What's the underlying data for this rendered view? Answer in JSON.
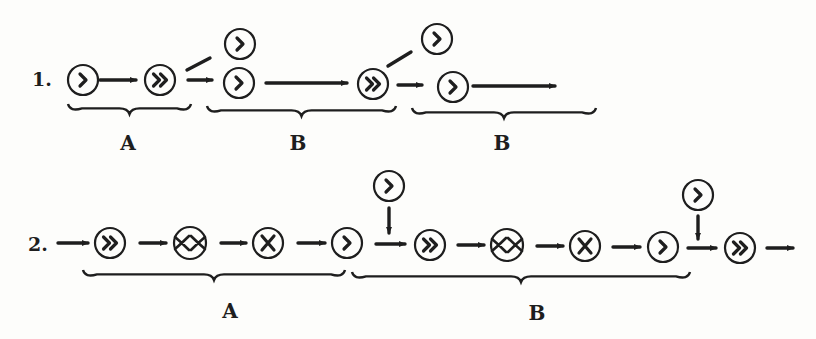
{
  "figure": {
    "background": "#fdfdfb",
    "ink": "#1e1e1e",
    "glyph_legend": {
      "single-chevron": "›",
      "double-chevron": "»",
      "cross": "×",
      "double-cross": "XX"
    },
    "rows": [
      {
        "label": "1.",
        "label_pos": [
          32,
          86
        ],
        "nodes": [
          {
            "id": "r1n1",
            "glyph": "single-chevron",
            "cx": 83,
            "cy": 80
          },
          {
            "id": "r1n2",
            "glyph": "double-chevron",
            "cx": 160,
            "cy": 80
          },
          {
            "id": "r1n3",
            "glyph": "single-chevron",
            "cx": 240,
            "cy": 44
          },
          {
            "id": "r1n4",
            "glyph": "single-chevron",
            "cx": 239,
            "cy": 83
          },
          {
            "id": "r1n5",
            "glyph": "double-chevron",
            "cx": 373,
            "cy": 84
          },
          {
            "id": "r1n6",
            "glyph": "single-chevron",
            "cx": 437,
            "cy": 39
          },
          {
            "id": "r1n7",
            "glyph": "single-chevron",
            "cx": 453,
            "cy": 87
          }
        ],
        "edges": [
          {
            "from": [
              100,
              80
            ],
            "to": [
              136,
              80
            ],
            "arrow": true
          },
          {
            "from": [
              187,
              70
            ],
            "to": [
              210,
              58
            ],
            "arrow": false
          },
          {
            "from": [
              188,
              80
            ],
            "to": [
              212,
              80
            ],
            "arrow": true
          },
          {
            "from": [
              266,
              83
            ],
            "to": [
              347,
              83
            ],
            "arrow": true
          },
          {
            "from": [
              388,
              66
            ],
            "to": [
              411,
              52
            ],
            "arrow": false
          },
          {
            "from": [
              398,
              85
            ],
            "to": [
              422,
              85
            ],
            "arrow": true
          },
          {
            "from": [
              473,
              86
            ],
            "to": [
              555,
              86
            ],
            "arrow": true
          }
        ],
        "braces": [
          {
            "label": "A",
            "x1": 68,
            "x2": 191,
            "y": 104,
            "label_x": 128,
            "label_y": 150
          },
          {
            "label": "B",
            "x1": 207,
            "x2": 396,
            "y": 106,
            "label_x": 298,
            "label_y": 150
          },
          {
            "label": "B",
            "x1": 412,
            "x2": 596,
            "y": 108,
            "label_x": 502,
            "label_y": 150
          }
        ]
      },
      {
        "label": "2.",
        "label_pos": [
          28,
          251
        ],
        "nodes": [
          {
            "id": "r2n1",
            "glyph": "double-chevron",
            "cx": 110,
            "cy": 243
          },
          {
            "id": "r2n2",
            "glyph": "double-cross",
            "cx": 190,
            "cy": 243
          },
          {
            "id": "r2n3",
            "glyph": "cross",
            "cx": 268,
            "cy": 243
          },
          {
            "id": "r2n4",
            "glyph": "single-chevron",
            "cx": 347,
            "cy": 243
          },
          {
            "id": "r2n5",
            "glyph": "single-chevron",
            "cx": 389,
            "cy": 186
          },
          {
            "id": "r2n6",
            "glyph": "double-chevron",
            "cx": 430,
            "cy": 245
          },
          {
            "id": "r2n7",
            "glyph": "double-cross",
            "cx": 507,
            "cy": 245
          },
          {
            "id": "r2n8",
            "glyph": "cross",
            "cx": 585,
            "cy": 246
          },
          {
            "id": "r2n9",
            "glyph": "single-chevron",
            "cx": 663,
            "cy": 247
          },
          {
            "id": "r2n10",
            "glyph": "single-chevron",
            "cx": 698,
            "cy": 195
          },
          {
            "id": "r2n11",
            "glyph": "double-chevron",
            "cx": 740,
            "cy": 248
          }
        ],
        "edges": [
          {
            "from": [
              58,
              243
            ],
            "to": [
              88,
              243
            ],
            "arrow": true
          },
          {
            "from": [
              140,
              243
            ],
            "to": [
              166,
              243
            ],
            "arrow": true
          },
          {
            "from": [
              221,
              243
            ],
            "to": [
              246,
              243
            ],
            "arrow": true
          },
          {
            "from": [
              298,
              243
            ],
            "to": [
              325,
              243
            ],
            "arrow": true
          },
          {
            "from": [
              389,
              208
            ],
            "to": [
              389,
              233
            ],
            "arrow": true
          },
          {
            "from": [
              376,
              244
            ],
            "to": [
              405,
              244
            ],
            "arrow": true
          },
          {
            "from": [
              458,
              245
            ],
            "to": [
              484,
              245
            ],
            "arrow": true
          },
          {
            "from": [
              537,
              246
            ],
            "to": [
              563,
              246
            ],
            "arrow": true
          },
          {
            "from": [
              613,
              247
            ],
            "to": [
              640,
              247
            ],
            "arrow": true
          },
          {
            "from": [
              698,
              216
            ],
            "to": [
              698,
              239
            ],
            "arrow": true
          },
          {
            "from": [
              688,
              248
            ],
            "to": [
              716,
              248
            ],
            "arrow": true
          },
          {
            "from": [
              767,
              248
            ],
            "to": [
              793,
              248
            ],
            "arrow": true
          }
        ],
        "braces": [
          {
            "label": "A",
            "x1": 83,
            "x2": 345,
            "y": 270,
            "label_x": 230,
            "label_y": 318
          },
          {
            "label": "B",
            "x1": 352,
            "x2": 690,
            "y": 272,
            "label_x": 537,
            "label_y": 320
          }
        ]
      }
    ]
  }
}
